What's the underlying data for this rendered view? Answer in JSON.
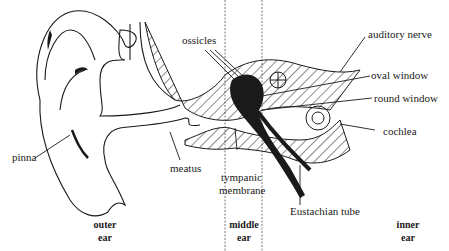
{
  "diagram": {
    "labels": {
      "ossicles": "ossicles",
      "auditory_nerve": "auditory nerve",
      "oval_window": "oval window",
      "round_window": "round window",
      "cochlea": "cochlea",
      "pinna": "pinna",
      "meatus": "meatus",
      "tympanic_membrane_1": "tympanic",
      "tympanic_membrane_2": "membrane",
      "eustachian_tube": "Eustachian tube"
    },
    "regions": {
      "outer_1": "outer",
      "outer_2": "ear",
      "middle_1": "middle",
      "middle_2": "ear",
      "inner_1": "inner",
      "inner_2": "ear"
    },
    "colors": {
      "line": "#1a1a1a",
      "background": "#ffffff"
    }
  }
}
